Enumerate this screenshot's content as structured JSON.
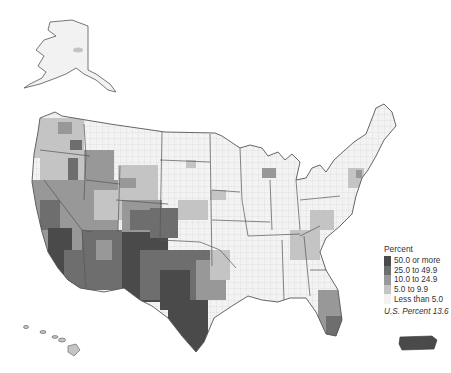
{
  "map": {
    "subject": "Percent of county population (choropleth)",
    "regions_shown": [
      "Contiguous United States",
      "Alaska",
      "Hawaii",
      "Puerto Rico"
    ],
    "boundaries": [
      "state",
      "county"
    ]
  },
  "legend": {
    "title": "Percent",
    "classes": [
      {
        "label": "50.0 or more",
        "color": "#4a4a4a"
      },
      {
        "label": "25.0 to 49.9",
        "color": "#6e6e6e"
      },
      {
        "label": "10.0 to 24.9",
        "color": "#989898"
      },
      {
        "label": "5.0 to 9.9",
        "color": "#c4c4c4"
      },
      {
        "label": "Less than 5.0",
        "color": "#f2f2f2"
      }
    ],
    "note": "U.S. Percent 13.6"
  },
  "colors": {
    "state_border": "#444444",
    "county_border": "#bdbdbd",
    "background": "#ffffff"
  }
}
